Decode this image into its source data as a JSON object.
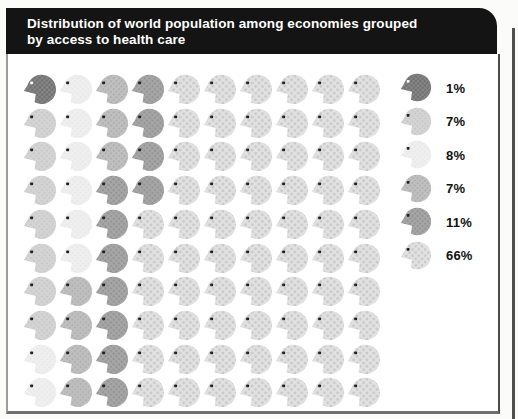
{
  "page": {
    "background": "#fbfbf9"
  },
  "header": {
    "title_line1": "Distribution of world population among economies grouped",
    "title_line2": "by access to health care",
    "bar_color": "#141414",
    "text_color": "#ffffff"
  },
  "chart_data": {
    "type": "pictogram",
    "title": "Distribution of world population among economies grouped by access to health care",
    "grid": {
      "rows": 10,
      "cols": 10,
      "total_units": 100,
      "unit_percent": 1,
      "fill_order": "column-major"
    },
    "categories": [
      {
        "label": "1%",
        "value": 1,
        "color": "#8a8a8a",
        "halftone_dot": "#707070",
        "eye_color": "#ffffff"
      },
      {
        "label": "7%",
        "value": 7,
        "color": "#d4d4d4",
        "halftone_dot": "#c7c7c7",
        "eye_color": "#222222"
      },
      {
        "label": "8%",
        "value": 8,
        "color": "#efefef",
        "halftone_dot": "#e6e6e6",
        "eye_color": "#222222"
      },
      {
        "label": "7%",
        "value": 7,
        "color": "#c0c0c0",
        "halftone_dot": "#b0b0b0",
        "eye_color": "#222222"
      },
      {
        "label": "11%",
        "value": 11,
        "color": "#a7a7a7",
        "halftone_dot": "#949494",
        "eye_color": "#222222"
      },
      {
        "label": "66%",
        "value": 66,
        "color": "#e1e1e1",
        "halftone_dot": "#c8c8c8",
        "eye_color": "#222222"
      }
    ],
    "legend_position": "right"
  }
}
